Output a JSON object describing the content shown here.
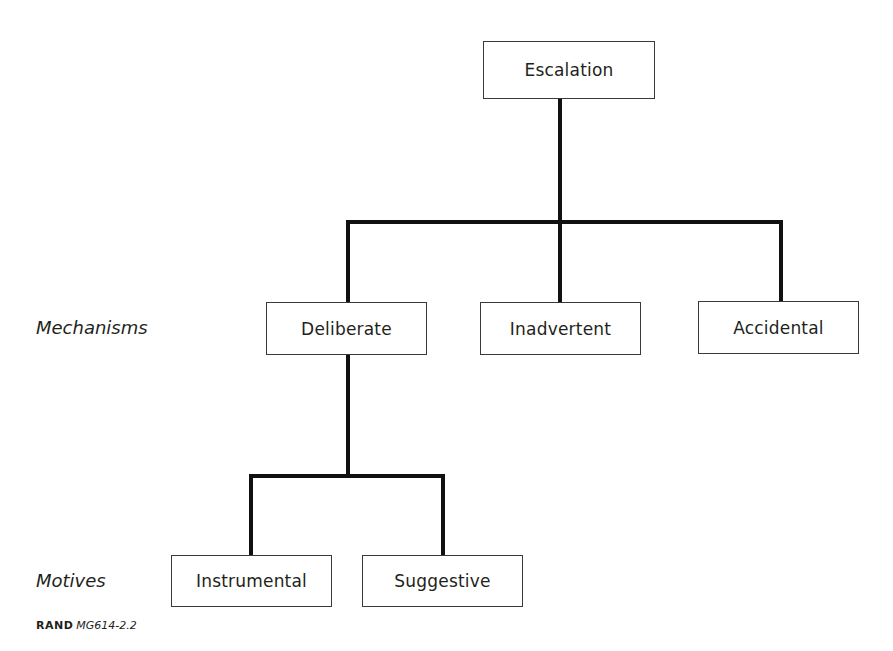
{
  "diagram": {
    "type": "tree",
    "root": {
      "label": "Escalation",
      "children": [
        {
          "label": "Deliberate",
          "children": [
            {
              "label": "Instrumental"
            },
            {
              "label": "Suggestive"
            }
          ]
        },
        {
          "label": "Inadvertent"
        },
        {
          "label": "Accidental"
        }
      ]
    },
    "row_labels": {
      "mechanisms": "Mechanisms",
      "motives": "Motives"
    },
    "footer": {
      "org": "RAND",
      "code": "MG614-2.2"
    },
    "colors": {
      "line": "#111111",
      "box_border": "#3a3a3a",
      "text": "#231f20",
      "background": "#ffffff"
    }
  }
}
